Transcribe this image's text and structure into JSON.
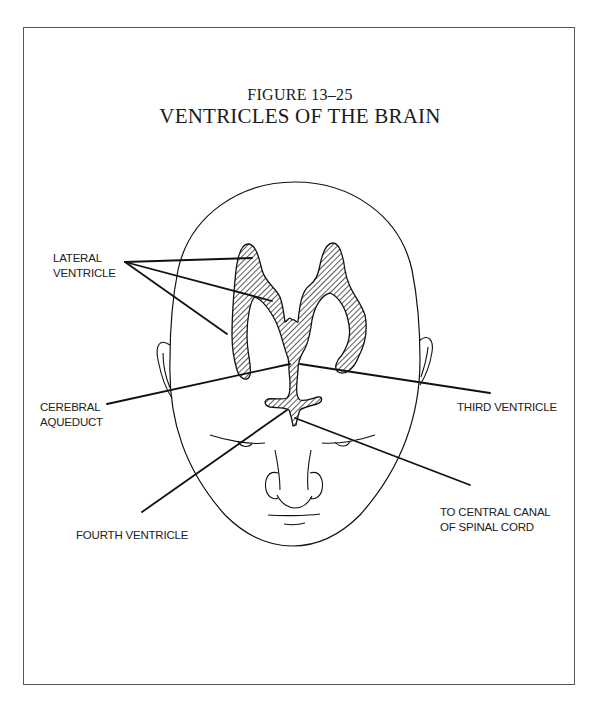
{
  "figure": {
    "number": "FIGURE 13–25",
    "title": "VENTRICLES OF THE BRAIN"
  },
  "labels": {
    "lateral_ventricle": [
      "LATERAL",
      "VENTRICLE"
    ],
    "cerebral_aqueduct": [
      "CEREBRAL",
      "AQUEDUCT"
    ],
    "third_ventricle": [
      "THIRD VENTRICLE"
    ],
    "central_canal": [
      "TO CENTRAL CANAL",
      "OF SPINAL CORD"
    ],
    "fourth_ventricle": [
      "FOURTH VENTRICLE"
    ]
  },
  "colors": {
    "line": "#111111",
    "frame": "#555555",
    "hatch": "#333333",
    "background": "#ffffff"
  }
}
